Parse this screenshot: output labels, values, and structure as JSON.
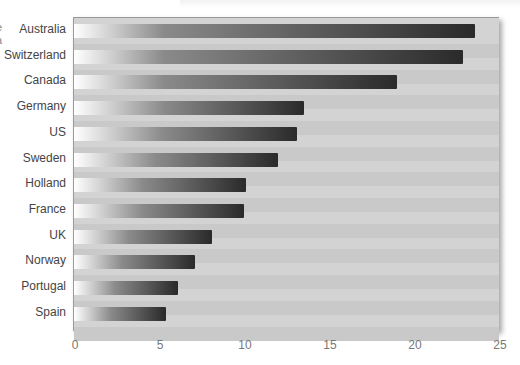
{
  "chart_data": {
    "type": "bar",
    "orientation": "horizontal",
    "title": "",
    "xlabel": "",
    "ylabel": "",
    "categories": [
      "Australia",
      "Switzerland",
      "Canada",
      "Germany",
      "US",
      "Sweden",
      "Holland",
      "France",
      "UK",
      "Norway",
      "Portugal",
      "Spain"
    ],
    "values": [
      23.6,
      22.9,
      19.0,
      13.5,
      13.1,
      12.0,
      10.1,
      10.0,
      8.1,
      7.1,
      6.1,
      5.4
    ],
    "xlim": [
      0,
      25
    ],
    "xticks": [
      "0",
      "5",
      "10",
      "15",
      "20",
      "25"
    ],
    "grid": false,
    "legend": null,
    "bar_style": "gradient white to dark gray"
  },
  "clipped_text": [
    "e",
    "a"
  ],
  "colors": {
    "plot_bg": "#d3d3d3",
    "bar_start": "#ffffff",
    "bar_end": "#2a2a2a"
  }
}
